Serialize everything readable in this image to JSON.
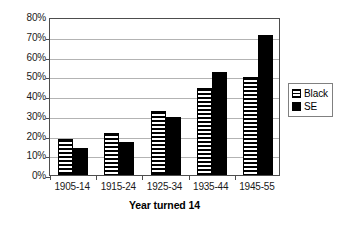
{
  "chart_data": {
    "type": "bar",
    "title": "",
    "xlabel": "Year turned 14",
    "ylabel": "",
    "categories": [
      "1905-14",
      "1915-24",
      "1925-34",
      "1935-44",
      "1945-55"
    ],
    "series": [
      {
        "name": "Black",
        "values": [
          18,
          21.5,
          32.5,
          44,
          49.5
        ]
      },
      {
        "name": "SE",
        "values": [
          13.5,
          16.5,
          29.5,
          52,
          71
        ]
      }
    ],
    "ylim": [
      0,
      80
    ],
    "ytick_labels": [
      "0%",
      "10%",
      "20%",
      "30%",
      "40%",
      "50%",
      "60%",
      "70%",
      "80%"
    ],
    "ytick_values": [
      0,
      10,
      20,
      30,
      40,
      50,
      60,
      70,
      80
    ],
    "grid": true,
    "legend_position": "right",
    "legend_entries": [
      {
        "label": "Black",
        "swatch": "horizontal-stripes"
      },
      {
        "label": "SE",
        "swatch": "solid-black"
      }
    ],
    "colors": {
      "series_black": "#000000",
      "series_se": "#000000",
      "gridline": "#b3b3b3",
      "axis": "#4d4d4d",
      "background": "#ffffff"
    }
  }
}
